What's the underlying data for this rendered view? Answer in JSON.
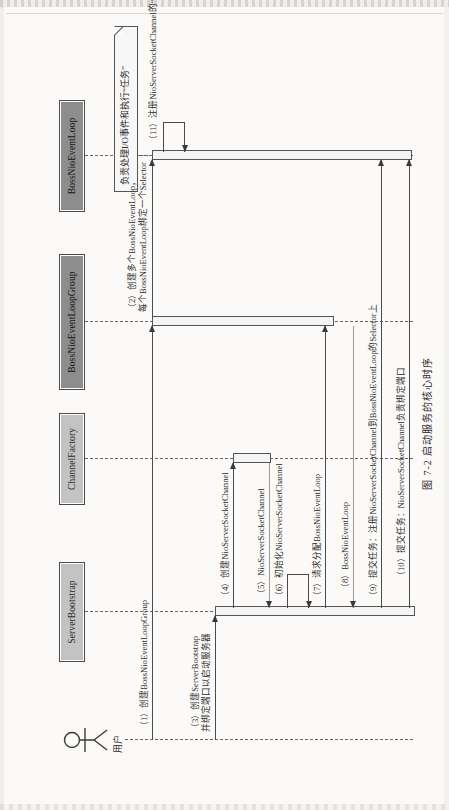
{
  "figure": {
    "caption": "图 7-2  启动服务的核心时序",
    "caption_number": "图 7-2",
    "caption_title": "启动服务的核心时序"
  },
  "diagram": {
    "type": "uml-sequence-diagram",
    "actor": {
      "name": "用户",
      "icon": "stick-figure-actor-icon"
    },
    "lifelines": [
      {
        "id": "serverbootstrap",
        "label": "ServerBootstrap",
        "shade": "light"
      },
      {
        "id": "channelfactory",
        "label": "ChannelFactory",
        "shade": "light"
      },
      {
        "id": "bossnioeventloopgroup",
        "label": "BossNioEventLoopGroup",
        "shade": "dark"
      },
      {
        "id": "bossnioeventloop",
        "label": "BossNioEventLoop",
        "shade": "dark"
      }
    ],
    "note": {
      "attached_to": "bossnioeventloop",
      "text": "负责处理I/O事件和执行“任务”"
    },
    "messages": [
      {
        "seq": "1",
        "label": "（1）创建BossNioEventLoopGroup",
        "from": "actor",
        "to": "bossnioeventloopgroup",
        "style": "solid"
      },
      {
        "seq": "2",
        "label": "（2）创建多个BossNioEventLoop，\n每个BossNioEventLoop绑定一个Selector",
        "from": "bossnioeventloopgroup",
        "to": "bossnioeventloop",
        "style": "solid"
      },
      {
        "seq": "3",
        "label": "（3）创建ServerBootstrap\n并绑定端口以启动服务器",
        "from": "actor",
        "to": "serverbootstrap",
        "style": "solid"
      },
      {
        "seq": "4",
        "label": "（4）创建NioServerSocketChannel",
        "from": "serverbootstrap",
        "to": "channelfactory",
        "style": "solid"
      },
      {
        "seq": "5",
        "label": "（5）NioServerSocketChannel",
        "from": "channelfactory",
        "to": "serverbootstrap",
        "style": "return"
      },
      {
        "seq": "6",
        "label": "（6）初始化NioServerSocketChannel",
        "from": "serverbootstrap",
        "to": "serverbootstrap",
        "style": "self"
      },
      {
        "seq": "7",
        "label": "（7）请求分配BossNioEventLoop",
        "from": "serverbootstrap",
        "to": "bossnioeventloopgroup",
        "style": "solid"
      },
      {
        "seq": "8",
        "label": "（8）BossNioEventLoop",
        "from": "bossnioeventloopgroup",
        "to": "serverbootstrap",
        "style": "return"
      },
      {
        "seq": "9",
        "label": "（9）提交任务：注册NioServerSocketChannel到BossNioEventLoop的Selector上",
        "from": "serverbootstrap",
        "to": "bossnioeventloop",
        "style": "solid"
      },
      {
        "seq": "10",
        "label": "（10）提交任务：NioServerSocketChannel负责绑定端口",
        "from": "serverbootstrap",
        "to": "bossnioeventloop",
        "style": "solid"
      },
      {
        "seq": "11",
        "label": "（11）注册NioServerSocketChannel的“读”事件",
        "from": "bossnioeventloop",
        "to": "bossnioeventloop",
        "style": "self"
      }
    ]
  },
  "colors": {
    "page_background": "#fbfaf8",
    "lifeline_head_light": "#c3c3c3",
    "lifeline_head_dark": "#8d8d8d",
    "line": "#4b4b4b",
    "note_background": "#f7f7f7",
    "text": "#2a2a2a"
  }
}
